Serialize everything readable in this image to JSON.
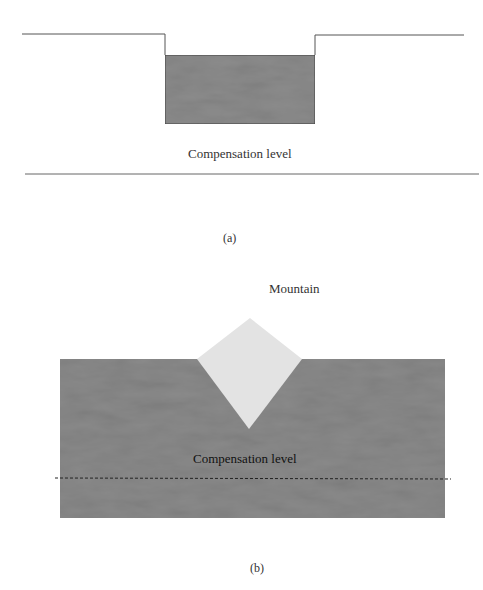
{
  "figure_a": {
    "label": "(a)",
    "compensation_label": "Compensation level",
    "block_color": "#8c8c8c",
    "line_color": "#555555"
  },
  "figure_b": {
    "label": "(b)",
    "mountain_label": "Mountain",
    "compensation_label": "Compensation level",
    "slab_color": "#8a8a8a",
    "mountain_color": "#e3e3e3"
  }
}
